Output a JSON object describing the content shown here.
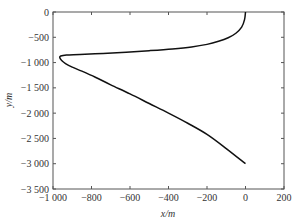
{
  "chart_data": {
    "type": "line",
    "title": "",
    "xlabel": "x/m",
    "ylabel": "y/m",
    "xlim": [
      -1000,
      200
    ],
    "ylim": [
      -3500,
      0
    ],
    "grid": false,
    "legend": null,
    "x_ticks": [
      -1000,
      -800,
      -600,
      -400,
      -200,
      0,
      200
    ],
    "x_tick_labels": [
      "−1 000",
      "−800",
      "−600",
      "−400",
      "−200",
      "0",
      "200"
    ],
    "y_ticks": [
      0,
      -500,
      -1000,
      -1500,
      -2000,
      -2500,
      -3000,
      -3500
    ],
    "y_tick_labels": [
      "0",
      "−500",
      "−1 000",
      "−1 500",
      "−2 000",
      "−2 500",
      "−3 000",
      "−3 500"
    ],
    "series": [
      {
        "name": "trajectory",
        "color": "#111111",
        "x": [
          0,
          -5,
          -20,
          -50,
          -90,
          -140,
          -200,
          -280,
          -380,
          -500,
          -620,
          -740,
          -860,
          -930,
          -960,
          -965,
          -955,
          -935,
          -900,
          -850,
          -780,
          -700,
          -600,
          -500,
          -400,
          -300,
          -200,
          -100,
          0
        ],
        "y": [
          0,
          -150,
          -300,
          -420,
          -510,
          -580,
          -640,
          -690,
          -730,
          -765,
          -795,
          -820,
          -840,
          -850,
          -870,
          -900,
          -960,
          -1020,
          -1090,
          -1170,
          -1290,
          -1440,
          -1620,
          -1810,
          -2000,
          -2200,
          -2420,
          -2700,
          -3000
        ]
      }
    ]
  }
}
